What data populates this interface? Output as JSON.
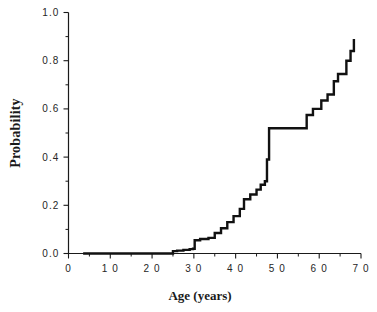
{
  "chart_data": {
    "type": "line",
    "subtype": "step-cumulative-distribution",
    "title": "",
    "subtitle": "",
    "xlabel": "Age   (years)",
    "ylabel": "Probability",
    "xlim": [
      0,
      70
    ],
    "ylim": [
      0.0,
      1.0
    ],
    "grid": false,
    "legend": null,
    "legend_position": "none",
    "xticks": [
      0,
      10,
      20,
      30,
      40,
      50,
      60,
      70
    ],
    "xtick_labels": [
      "0",
      "1 0",
      "2 0",
      "3 0",
      "4 0",
      "5 0",
      "6 0",
      "7 0"
    ],
    "xminor_ticks": [
      5,
      15,
      25,
      35,
      45,
      55,
      65
    ],
    "yticks": [
      0.0,
      0.2,
      0.4,
      0.6,
      0.8,
      1.0
    ],
    "ytick_labels": [
      "0.0",
      "0.2",
      "0.4",
      "0.6",
      "0.8",
      "1.0"
    ],
    "yminor_ticks": [
      0.1,
      0.3,
      0.5,
      0.7,
      0.9
    ],
    "line_color": "#111111",
    "series": [
      {
        "name": "Cumulative probability by age",
        "step": "post",
        "x": [
          3.5,
          24.0,
          25.0,
          26.0,
          27.5,
          29.0,
          29.8,
          30.2,
          31.5,
          33.5,
          35.0,
          36.5,
          38.0,
          39.5,
          41.0,
          42.0,
          43.5,
          45.0,
          46.0,
          47.0,
          47.5,
          48.0,
          55.8,
          57.0,
          58.5,
          60.5,
          62.0,
          63.5,
          64.5,
          66.5,
          67.5,
          68.3
        ],
        "y": [
          0.0,
          0.0,
          0.01,
          0.012,
          0.015,
          0.018,
          0.02,
          0.055,
          0.06,
          0.065,
          0.085,
          0.105,
          0.13,
          0.155,
          0.185,
          0.225,
          0.245,
          0.265,
          0.285,
          0.3,
          0.39,
          0.52,
          0.52,
          0.575,
          0.6,
          0.635,
          0.66,
          0.715,
          0.745,
          0.8,
          0.84,
          0.89
        ]
      }
    ]
  },
  "axes": {
    "x_axis_name": "age-axis",
    "y_axis_name": "probability-axis"
  }
}
